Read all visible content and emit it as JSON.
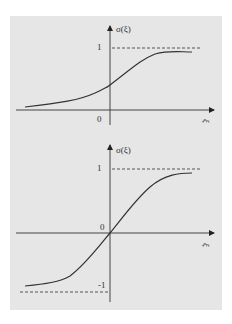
{
  "figure": {
    "top_plot": {
      "title": "Logistic sigmoid",
      "y_label": "σ(ξ)",
      "x_label": "ξ",
      "y_tick_upper": "1",
      "origin_label": "0"
    },
    "bottom_plot": {
      "title": "Hyperbolic tangent sigmoid",
      "y_label": "σ(ξ)",
      "x_label": "ξ",
      "y_tick_upper": "1",
      "y_tick_lower": "-1",
      "origin_label": "0"
    },
    "colors": {
      "background": "#e6e6e6",
      "line": "#333333"
    }
  }
}
